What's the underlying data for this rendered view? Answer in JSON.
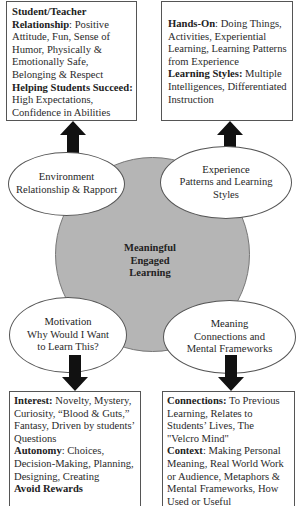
{
  "center": {
    "line1": "Meaningful",
    "line2": "Engaged",
    "line3": "Learning"
  },
  "ellipses": {
    "environment": {
      "title": "Environment",
      "sub1": "Relationship & Rapport"
    },
    "experience": {
      "title": "Experience",
      "sub1": "Patterns and Learning",
      "sub2": "Styles"
    },
    "motivation": {
      "title": "Motivation",
      "sub1": "Why Would I Want",
      "sub2": "to Learn This?"
    },
    "meaning": {
      "title": "Meaning",
      "sub1": "Connections and",
      "sub2": "Mental Frameworks"
    }
  },
  "boxes": {
    "environment": {
      "head1": "Student/Teacher",
      "head2": "Relationship",
      "text1": ": Positive",
      "l3": "Attitude, Fun, Sense of",
      "l4": "Humor, Physically &",
      "l5": "Emotionally Safe,",
      "l6": "Belonging & Respect",
      "head3": "Helping Students Succeed:",
      "l8": "High Expectations,",
      "l9": "Confidence in Abilities"
    },
    "experience": {
      "head1": "Hands-On",
      "text1": ": Doing Things,",
      "l2": "Activities, Experiential",
      "l3": "Learning, Learning Patterns",
      "l4": "from Experience",
      "head2": "Learning Styles:",
      "text2": " Multiple",
      "l6": "Intelligences, Differentiated",
      "l7": "Instruction"
    },
    "motivation": {
      "head1": "Interest:",
      "text1": " Novelty, Mystery,",
      "l2": "Curiosity, “Blood & Guts,”",
      "l3": "Fantasy, Driven by students’",
      "l4": "Questions",
      "head2": "Autonomy",
      "text2": ": Choices,",
      "l6": "Decision-Making, Planning,",
      "l7": "Designing, Creating",
      "head3": "Avoid Rewards"
    },
    "meaning": {
      "head1": "Connections:",
      "text1": " To Previous",
      "l2": "Learning, Relates to",
      "l3": "Students’ Lives, The",
      "l4": "\"Velcro Mind\"",
      "head2": "Context",
      "text2": ": Making Personal",
      "l6": "Meaning, Real World Work",
      "l7": "or Audience, Metaphors &",
      "l8": "Mental Frameworks, How",
      "l9": "Used or Useful"
    }
  },
  "colors": {
    "circle_fill": "#b5b5b5",
    "arrow": "#111111",
    "box_border": "#555555"
  }
}
